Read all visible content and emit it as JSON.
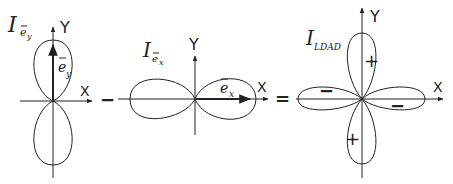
{
  "panels": [
    {
      "id": "ey",
      "title_main": "I",
      "title_sub": "e",
      "title_subsub": "y",
      "axis_x": "X",
      "axis_y": "Y",
      "vector_label": "e",
      "vector_sub": "y"
    },
    {
      "id": "ex",
      "title_main": "I",
      "title_sub": "e",
      "title_subsub": "x",
      "axis_x": "X",
      "axis_y": "Y",
      "vector_label": "e",
      "vector_sub": "x"
    },
    {
      "id": "ldad",
      "title_main": "I",
      "title_sub": "LDAD",
      "axis_x": "X",
      "axis_y": "Y",
      "lobe_signs": {
        "top": "+",
        "bottom": "+",
        "left": "−",
        "right": "−"
      }
    }
  ],
  "operators": {
    "minus": "−",
    "equals": "="
  },
  "colors": {
    "ink": "#222222",
    "background": "#ffffff"
  }
}
